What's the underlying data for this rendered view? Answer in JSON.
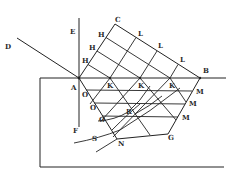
{
  "figure": {
    "labels": {
      "A": "A",
      "B": "B",
      "C": "C",
      "D": "D",
      "E": "E",
      "F": "F",
      "G": "G",
      "N": "N",
      "R": "R",
      "S": "S",
      "H": "H",
      "L": "L",
      "K": "K",
      "O": "O",
      "M": "M"
    },
    "colors": {
      "ink": "#222222",
      "background": "#ffffff"
    }
  }
}
